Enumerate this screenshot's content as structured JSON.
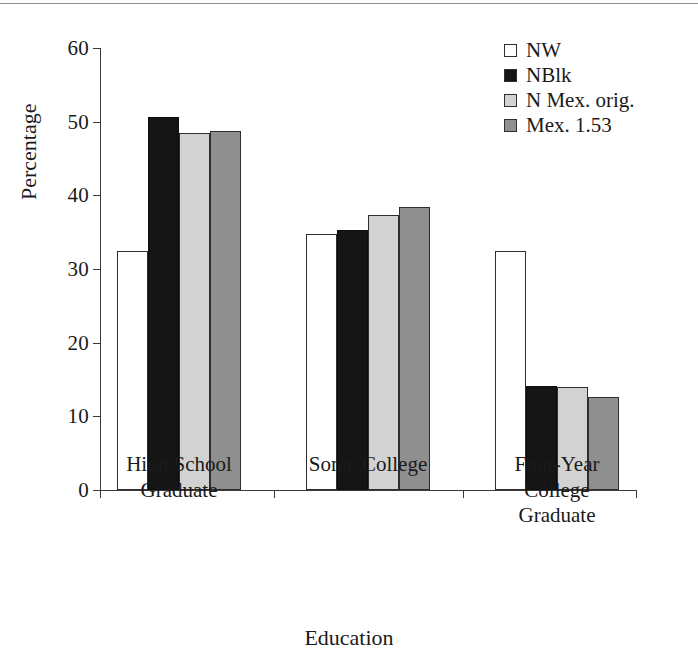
{
  "chart_data": {
    "type": "bar",
    "title": "",
    "xlabel": "Education",
    "ylabel": "Percentage",
    "ylim": [
      0,
      60
    ],
    "yticks": [
      0,
      10,
      20,
      30,
      40,
      50,
      60
    ],
    "ytick_labels": [
      "0",
      "10",
      "20",
      "30",
      "40",
      "50",
      "60"
    ],
    "grid": false,
    "legend_position": "top-right",
    "categories": [
      "High School\nGraduate",
      "Some College",
      "Four-Year\nCollege\nGraduate"
    ],
    "series": [
      {
        "name": "NW",
        "color": "#ffffff",
        "values": [
          32.4,
          34.7,
          32.4
        ]
      },
      {
        "name": "NBlk",
        "color": "#151515",
        "values": [
          50.6,
          35.3,
          14.1
        ]
      },
      {
        "name": "N Mex. orig.",
        "color": "#d2d2d2",
        "values": [
          48.4,
          37.4,
          14.0
        ]
      },
      {
        "name": "Mex. 1.53",
        "color": "#8f8f8f",
        "values": [
          48.7,
          38.4,
          12.6
        ]
      }
    ]
  },
  "legend": {
    "items": [
      {
        "label": "NW",
        "swatch": "#ffffff"
      },
      {
        "label": "NBlk",
        "swatch": "#151515"
      },
      {
        "label": "N Mex. orig.",
        "swatch": "#d2d2d2"
      },
      {
        "label": "Mex. 1.53",
        "swatch": "#8f8f8f"
      }
    ]
  },
  "axes": {
    "y_title": "Percentage",
    "x_title": "Education"
  }
}
